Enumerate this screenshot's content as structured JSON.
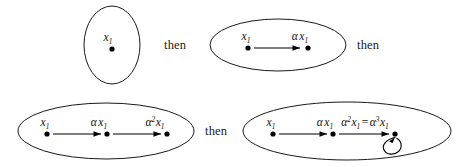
{
  "figure": {
    "connector_label": "then",
    "stroke_color": "#1a1a1a",
    "dot_color": "#000000",
    "background_color": "#ffffff",
    "stages": [
      {
        "id": "stage-1",
        "shape": "vertical-ellipse",
        "nodes": [
          {
            "id": "n1",
            "base": "x",
            "sub": "1",
            "sup": "",
            "coeff": ""
          }
        ],
        "arrows": 0,
        "self_loop": false
      },
      {
        "id": "stage-2",
        "shape": "horizontal-ellipse",
        "nodes": [
          {
            "id": "n1",
            "base": "x",
            "sub": "1",
            "sup": "",
            "coeff": ""
          },
          {
            "id": "n2",
            "base": "x",
            "sub": "1",
            "sup": "",
            "coeff": "α"
          }
        ],
        "arrows": 1,
        "self_loop": false
      },
      {
        "id": "stage-3",
        "shape": "horizontal-ellipse",
        "nodes": [
          {
            "id": "n1",
            "base": "x",
            "sub": "1",
            "sup": "",
            "coeff": ""
          },
          {
            "id": "n2",
            "base": "x",
            "sub": "1",
            "sup": "",
            "coeff": "α"
          },
          {
            "id": "n3",
            "base": "x",
            "sub": "1",
            "sup": "2",
            "coeff": "α"
          }
        ],
        "arrows": 2,
        "self_loop": false
      },
      {
        "id": "stage-4",
        "shape": "horizontal-ellipse",
        "nodes": [
          {
            "id": "n1",
            "base": "x",
            "sub": "1",
            "sup": "",
            "coeff": ""
          },
          {
            "id": "n2",
            "base": "x",
            "sub": "1",
            "sup": "",
            "coeff": "α"
          },
          {
            "id": "n3",
            "base": "x",
            "sub": "1",
            "sup": "2",
            "coeff": "α",
            "equals": "=",
            "base2": "x",
            "sub2": "1",
            "sup2": "3",
            "coeff2": "α"
          }
        ],
        "arrows": 2,
        "self_loop": true
      }
    ],
    "labels": {
      "x1": "x",
      "x1_sub": "1",
      "alpha": "α",
      "alpha_sq_sup": "2",
      "alpha_cube_sup": "3",
      "equals": "="
    },
    "then_1": "then",
    "then_2": "then",
    "then_3": "then"
  }
}
